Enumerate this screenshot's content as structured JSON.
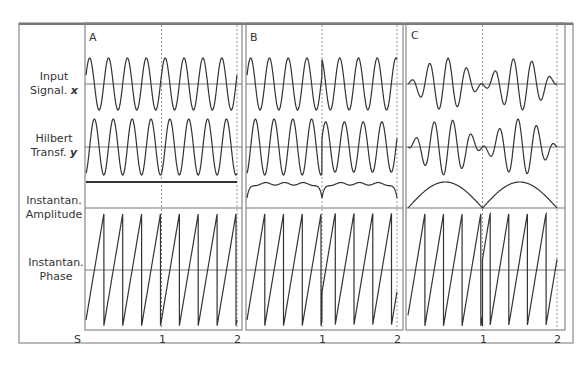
{
  "figure": {
    "row_labels": [
      {
        "line1": "Input",
        "line2": "Signal. ",
        "var": "x"
      },
      {
        "line1": "Hilbert",
        "line2": "Transf. ",
        "var": "y"
      },
      {
        "line1": "Instantan.",
        "line2": "Amplitude",
        "var": ""
      },
      {
        "line1": "Instantan.",
        "line2": "Phase",
        "var": ""
      }
    ],
    "panels": [
      {
        "label": "A",
        "description": "constant-frequency sinusoid; constant amplitude; regular sawtooth phase"
      },
      {
        "label": "B",
        "description": "sinusoid with phase reset at t=1; amplitude dips at 0, 1, 2 with ripples"
      },
      {
        "label": "C",
        "description": "amplitude-modulated beat signal; amplitude arches with minima at 0, 1, 2"
      }
    ],
    "x_axis": {
      "unit_label": "S",
      "ticks": [
        "1",
        "2"
      ]
    },
    "colors": {
      "trace": "#333333",
      "frame": "#888888",
      "baseline": "#777777",
      "dashed": "#999999"
    }
  }
}
